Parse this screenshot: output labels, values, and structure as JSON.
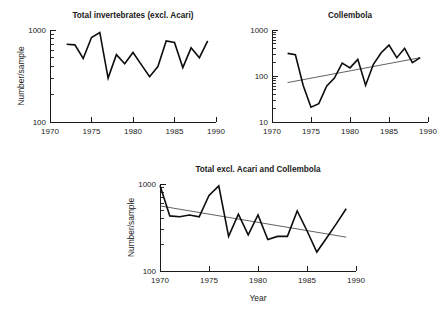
{
  "figure": {
    "background": "#ffffff",
    "line_color": "#0d0d0d",
    "trend_color": "#3a3a3a",
    "axis_color": "#1a1a1a"
  },
  "chart_data": [
    {
      "id": "total-invertebrates-excl-acari",
      "type": "line",
      "title": "Total invertebrates (excl. Acari)",
      "xlabel": "",
      "ylabel": "Number/sample",
      "xlim": [
        1970,
        1990
      ],
      "ylim": [
        100,
        1000
      ],
      "yscale": "log",
      "xticks": [
        1970,
        1975,
        1980,
        1985,
        1990
      ],
      "xticklabels": [
        "1970",
        "1975",
        "1980",
        "1985",
        "1990"
      ],
      "yticks": [
        100,
        1000
      ],
      "yticklabels": [
        "100",
        "1000"
      ],
      "grid": false,
      "legend": "none",
      "trendline": null,
      "x": [
        1972,
        1973,
        1974,
        1975,
        1976,
        1977,
        1978,
        1979,
        1980,
        1981,
        1982,
        1983,
        1984,
        1985,
        1986,
        1987,
        1988,
        1989
      ],
      "values": [
        700,
        690,
        490,
        830,
        940,
        300,
        540,
        430,
        570,
        420,
        310,
        400,
        760,
        730,
        390,
        640,
        500,
        760
      ]
    },
    {
      "id": "collembola",
      "type": "line",
      "title": "Collembola",
      "xlabel": "",
      "ylabel": "",
      "xlim": [
        1970,
        1990
      ],
      "ylim": [
        10,
        1000
      ],
      "yscale": "log",
      "xticks": [
        1970,
        1975,
        1980,
        1985,
        1990
      ],
      "xticklabels": [
        "1970",
        "1975",
        "1980",
        "1985",
        "1990"
      ],
      "yticks": [
        10,
        100,
        1000
      ],
      "yticklabels": [
        "10",
        "100",
        "1000"
      ],
      "grid": false,
      "legend": "none",
      "trendline": {
        "x": [
          1972,
          1989
        ],
        "y": [
          72,
          250
        ],
        "direction": "increasing"
      },
      "x": [
        1972,
        1973,
        1974,
        1975,
        1976,
        1977,
        1978,
        1979,
        1980,
        1981,
        1982,
        1983,
        1984,
        1985,
        1986,
        1987,
        1988,
        1989
      ],
      "values": [
        310,
        290,
        62,
        21,
        25,
        60,
        90,
        190,
        150,
        230,
        63,
        180,
        320,
        470,
        250,
        400,
        195,
        250
      ]
    },
    {
      "id": "total-excl-acari-and-collembola",
      "type": "line",
      "title": "Total excl. Acari and Collembola",
      "xlabel": "Year",
      "ylabel": "Number/sample",
      "xlim": [
        1970,
        1990
      ],
      "ylim": [
        100,
        1000
      ],
      "yscale": "log",
      "xticks": [
        1970,
        1975,
        1980,
        1985,
        1990
      ],
      "xticklabels": [
        "1970",
        "1975",
        "1980",
        "1985",
        "1990"
      ],
      "yticks": [
        100,
        1000
      ],
      "yticklabels": [
        "100",
        "1000"
      ],
      "grid": false,
      "legend": "none",
      "trendline": {
        "x": [
          1970,
          1989
        ],
        "y": [
          560,
          245
        ],
        "direction": "decreasing"
      },
      "x": [
        1970,
        1971,
        1972,
        1973,
        1974,
        1975,
        1976,
        1977,
        1978,
        1979,
        1980,
        1981,
        1982,
        1983,
        1984,
        1985,
        1986,
        1987,
        1988,
        1989
      ],
      "values": [
        960,
        430,
        420,
        440,
        420,
        740,
        950,
        250,
        450,
        260,
        440,
        230,
        250,
        250,
        490,
        290,
        165,
        240,
        350,
        520
      ]
    }
  ]
}
